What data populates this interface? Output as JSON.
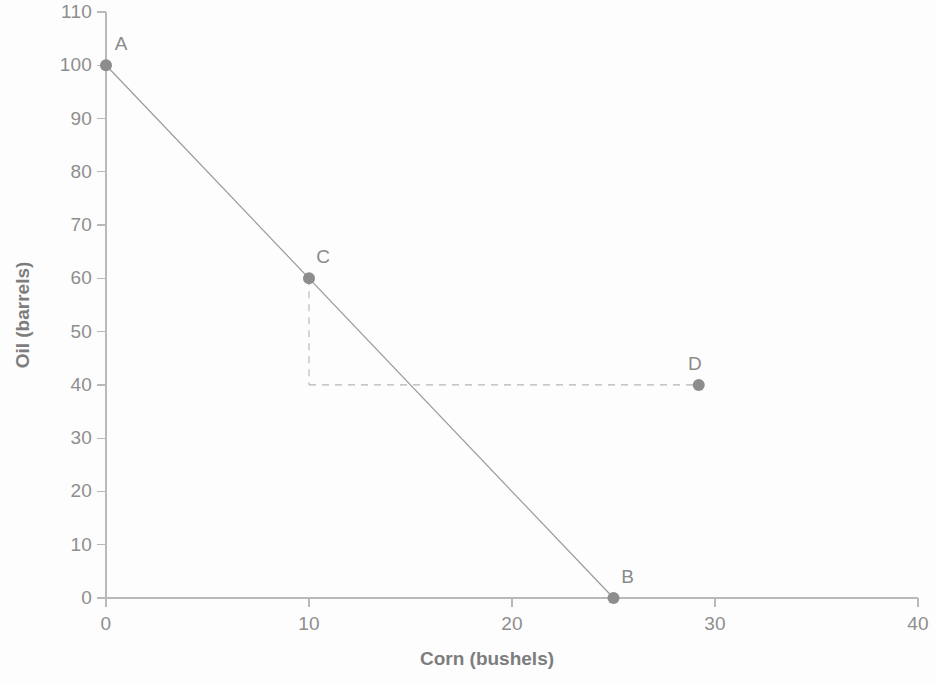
{
  "chart_data": {
    "type": "line",
    "title": "",
    "xlabel": "Corn (bushels)",
    "ylabel": "Oil (barrels)",
    "xlim": [
      0,
      40
    ],
    "ylim": [
      0,
      110
    ],
    "xticks": [
      "0",
      "10",
      "20",
      "30",
      "40"
    ],
    "xtick_values": [
      0,
      10,
      20,
      30,
      40
    ],
    "yticks": [
      "0",
      "10",
      "20",
      "30",
      "40",
      "50",
      "60",
      "70",
      "80",
      "90",
      "100",
      "110"
    ],
    "ytick_values": [
      0,
      10,
      20,
      30,
      40,
      50,
      60,
      70,
      80,
      90,
      100,
      110
    ],
    "grid": false,
    "legend": null,
    "series": [
      {
        "name": "Production possibilities frontier",
        "type": "line",
        "style": "solid",
        "color": "#9a9a9a",
        "x": [
          0,
          25
        ],
        "y": [
          100,
          0
        ]
      },
      {
        "name": "guide-vertical-C-to-40",
        "type": "line",
        "style": "dashed",
        "color": "#b5b5b5",
        "x": [
          10,
          10
        ],
        "y": [
          60,
          40
        ]
      },
      {
        "name": "guide-horizontal-40-to-D",
        "type": "line",
        "style": "dashed",
        "color": "#b5b5b5",
        "x": [
          10,
          29.2
        ],
        "y": [
          40,
          40
        ]
      }
    ],
    "points": [
      {
        "label": "A",
        "x": 0,
        "y": 100,
        "label_dx": 15,
        "label_dy": -10
      },
      {
        "label": "C",
        "x": 10,
        "y": 60,
        "label_dx": 14,
        "label_dy": -10
      },
      {
        "label": "B",
        "x": 25,
        "y": 0,
        "label_dx": 14,
        "label_dy": -10
      },
      {
        "label": "D",
        "x": 29.2,
        "y": 40,
        "label_dx": -4,
        "label_dy": -10
      }
    ],
    "marker_color": "#8d8d8d",
    "axis_color": "#b9b9b9"
  }
}
